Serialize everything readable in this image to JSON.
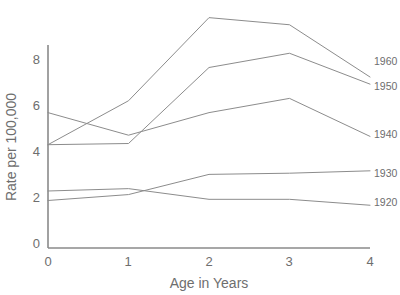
{
  "chart_data": {
    "type": "line",
    "title": "",
    "xlabel": "Age in Years",
    "ylabel": "Rate per 100,000",
    "x": [
      0,
      1,
      2,
      3,
      4
    ],
    "xticklabels": [
      "0",
      "1",
      "2",
      "3",
      "4"
    ],
    "yticklabels": [
      "0",
      "2",
      "4",
      "6",
      "8"
    ],
    "yticks": [
      0,
      2,
      4,
      6,
      8
    ],
    "xlim": [
      0,
      4
    ],
    "ylim": [
      0,
      10
    ],
    "grid": false,
    "legend_position": "right-inline-labels",
    "series": [
      {
        "name": "1960",
        "values": [
          4.35,
          6.2,
          9.7,
          9.4,
          7.2
        ],
        "color": "#8c8c8c"
      },
      {
        "name": "1950",
        "values": [
          4.35,
          4.4,
          7.6,
          8.2,
          6.9
        ],
        "color": "#8c8c8c"
      },
      {
        "name": "1940",
        "values": [
          5.7,
          4.75,
          5.7,
          6.3,
          4.7
        ],
        "color": "#8c8c8c"
      },
      {
        "name": "1930",
        "values": [
          2.0,
          2.25,
          3.1,
          3.15,
          3.25
        ],
        "color": "#8c8c8c"
      },
      {
        "name": "1920",
        "values": [
          2.4,
          2.5,
          2.05,
          2.05,
          1.8
        ],
        "color": "#8c8c8c"
      }
    ]
  },
  "axis": {
    "y_title": "Rate per 100,000",
    "x_title": "Age in Years",
    "y_ticks": [
      "8",
      "6",
      "4",
      "2",
      "0"
    ],
    "x_ticks": [
      "0",
      "1",
      "2",
      "3",
      "4"
    ]
  },
  "series_labels": [
    "1960",
    "1950",
    "1940",
    "1930",
    "1920"
  ],
  "colors": {
    "axis": "#8a8a8a",
    "line": "#8c8c8c",
    "text": "#6e6e6e",
    "background": "#ffffff"
  }
}
